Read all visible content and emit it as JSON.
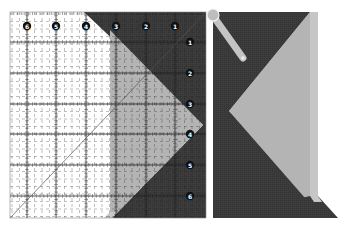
{
  "figure": {
    "colors": {
      "background": "#ffffff",
      "fabric_dark": "#3a3a3a",
      "fabric_light": "#b4b4b4",
      "ruler_clear": "#ffffff",
      "ruler_marks": "#222222",
      "label_fill": "#111111",
      "label_text": "#ffffff",
      "pivot": "#bdbdbd"
    }
  },
  "ruler": {
    "top_labels": [
      "6",
      "5",
      "4",
      "3",
      "2",
      "1"
    ],
    "right_labels": [
      "1",
      "2",
      "3",
      "4",
      "5",
      "6"
    ],
    "inch_spacing_px": 30
  },
  "right_panel": {
    "pivot_marker": "rotation-pivot",
    "handle": "rotate-handle"
  }
}
